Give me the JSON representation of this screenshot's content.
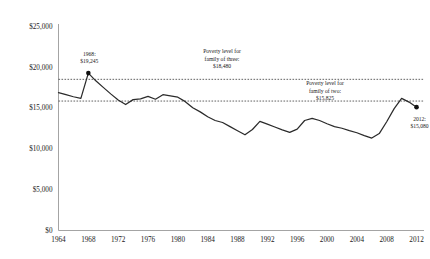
{
  "chart_data": {
    "type": "line",
    "title": "",
    "subtitle": "",
    "xlabel": "",
    "ylabel": "",
    "xlim": [
      1964,
      2013
    ],
    "ylim": [
      0,
      25000
    ],
    "grid": false,
    "legend_position": "none",
    "y_ticks": [
      "$0",
      "$5,000",
      "$10,000",
      "$15,000",
      "$20,000",
      "$25,000"
    ],
    "y_tick_values": [
      0,
      5000,
      10000,
      15000,
      20000,
      25000
    ],
    "x_ticks": [
      "1964",
      "1968",
      "1972",
      "1976",
      "1980",
      "1984",
      "1988",
      "1992",
      "1996",
      "2000",
      "2004",
      "2008",
      "2012"
    ],
    "x_tick_values": [
      1964,
      1968,
      1972,
      1976,
      1980,
      1984,
      1988,
      1992,
      1996,
      2000,
      2004,
      2008,
      2012
    ],
    "x": [
      1964,
      1965,
      1966,
      1967,
      1968,
      1969,
      1970,
      1971,
      1972,
      1973,
      1974,
      1975,
      1976,
      1977,
      1978,
      1979,
      1980,
      1981,
      1982,
      1983,
      1984,
      1985,
      1986,
      1987,
      1988,
      1989,
      1990,
      1991,
      1992,
      1993,
      1994,
      1995,
      1996,
      1997,
      1998,
      1999,
      2000,
      2001,
      2002,
      2003,
      2004,
      2005,
      2006,
      2007,
      2008,
      2009,
      2010,
      2011,
      2012
    ],
    "series": [
      {
        "name": "Annual value of full-time minimum wage work",
        "values": [
          16850,
          16600,
          16350,
          16150,
          19245,
          18300,
          17500,
          16700,
          15950,
          15400,
          16000,
          16100,
          16400,
          16050,
          16600,
          16450,
          16300,
          15750,
          15000,
          14500,
          13900,
          13450,
          13200,
          12700,
          12200,
          11700,
          12350,
          13350,
          13000,
          12650,
          12300,
          12000,
          12400,
          13450,
          13700,
          13450,
          13050,
          12700,
          12500,
          12200,
          11950,
          11600,
          11300,
          11850,
          13300,
          14900,
          16150,
          15700,
          15080
        ]
      }
    ],
    "reference_lines": [
      {
        "name": "poverty-level-family-of-three",
        "value": 18480,
        "label_lines": [
          "Poverty level for",
          "family of three:",
          "$18,480"
        ]
      },
      {
        "name": "poverty-level-family-of-two",
        "value": 15825,
        "label_lines": [
          "Poverty level for",
          "family of two:",
          "$15,825"
        ]
      }
    ],
    "annotations": [
      {
        "name": "peak-1968",
        "x": 1968,
        "y": 19245,
        "label_lines": [
          "1968:",
          "$19,245"
        ],
        "marker": true
      },
      {
        "name": "endpoint-2012",
        "x": 2012,
        "y": 15080,
        "label_lines": [
          "2012:",
          "$15,080"
        ],
        "marker": true
      }
    ],
    "colors": {
      "line": "#2b2b2b",
      "reference": "#3a3a3a",
      "axis": "#9a9a9a",
      "text": "#1a1a1a",
      "background": "#ffffff"
    }
  }
}
